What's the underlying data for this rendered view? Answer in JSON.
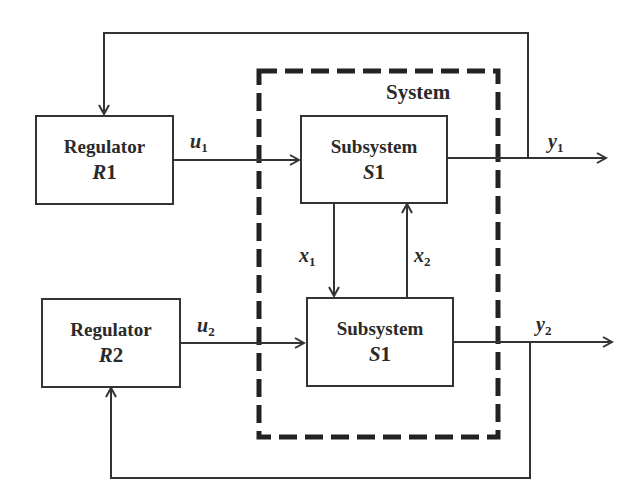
{
  "diagram": {
    "system_label": "System",
    "regulators": [
      {
        "title": "Regulator",
        "symbol_letter": "R",
        "symbol_index": "1"
      },
      {
        "title": "Regulator",
        "symbol_letter": "R",
        "symbol_index": "2"
      }
    ],
    "subsystems": [
      {
        "title": "Subsystem",
        "symbol_letter": "S",
        "symbol_index": "1"
      },
      {
        "title": "Subsystem",
        "symbol_letter": "S",
        "symbol_index": "1"
      }
    ],
    "signals": {
      "u1": {
        "letter": "u",
        "index": "1"
      },
      "u2": {
        "letter": "u",
        "index": "2"
      },
      "y1": {
        "letter": "y",
        "index": "1"
      },
      "y2": {
        "letter": "y",
        "index": "2"
      },
      "x1": {
        "letter": "x",
        "index": "1"
      },
      "x2": {
        "letter": "x",
        "index": "2"
      }
    },
    "colors": {
      "line": "#333333",
      "dashed_border": "#222222",
      "background": "#ffffff"
    }
  }
}
